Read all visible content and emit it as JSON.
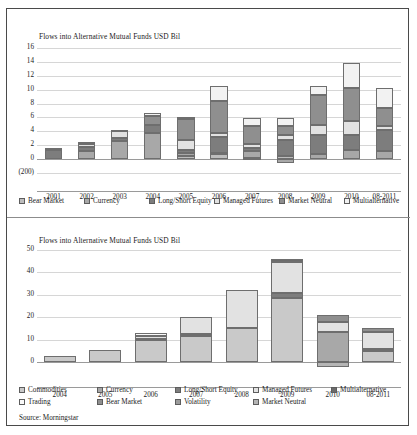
{
  "figure": {
    "source_note": "Source: Morningstar",
    "palette": {
      "bear_market": "#bdbdbd",
      "currency": "#a8a8a8",
      "long_short_equity": "#7d7d7d",
      "managed_futures": "#e2e2e2",
      "market_neutral": "#8f8f8f",
      "multialternative": "#f2f2f2",
      "commodities": "#c9c9c9",
      "trading": "#fafafa",
      "volatility": "#9b9b9b",
      "grid": "#d6d6d6",
      "axis": "#9a9a9a",
      "border": "#4a4a4a",
      "text": "#1c1c1c"
    }
  },
  "chart_data": [
    {
      "type": "bar",
      "id": "top-chart",
      "stacked": true,
      "title": "Flows into Alternative Mutual Funds USD Bil",
      "xlabel": "",
      "ylabel": "",
      "ylim": [
        -2,
        17
      ],
      "yticks": [
        "16",
        "14",
        "12",
        "10",
        "8",
        "6",
        "4",
        "2",
        "0",
        "(200)"
      ],
      "ytick_values": [
        16,
        14,
        12,
        10,
        8,
        6,
        4,
        2,
        0,
        -2
      ],
      "grid": true,
      "legend_position": "bottom",
      "categories": [
        "2001",
        "2002",
        "2003",
        "2004",
        "2005",
        "2006",
        "2007",
        "2008",
        "2009",
        "2010",
        "08-2011"
      ],
      "series": [
        {
          "name": "Bear Market",
          "color": "#bdbdbd",
          "values": [
            0.0,
            0.0,
            0.0,
            0.0,
            0.5,
            0.7,
            0.2,
            0.4,
            0.0,
            0.0,
            0.0
          ]
        },
        {
          "name": "Currency",
          "color": "#a8a8a8",
          "values": [
            0.0,
            1.1,
            2.6,
            3.8,
            0.4,
            0.2,
            0.9,
            -0.5,
            0.8,
            1.3,
            1.2
          ]
        },
        {
          "name": "Long/Short Equity",
          "color": "#7d7d7d",
          "values": [
            1.3,
            0.6,
            0.5,
            1.1,
            0.4,
            2.3,
            0.5,
            2.4,
            2.6,
            2.2,
            3.0
          ]
        },
        {
          "name": "Managed Futures",
          "color": "#e2e2e2",
          "values": [
            0.0,
            0.5,
            0.9,
            0.0,
            1.4,
            0.5,
            0.6,
            0.6,
            1.5,
            2.0,
            0.6
          ]
        },
        {
          "name": "Market Neutral",
          "color": "#8f8f8f",
          "values": [
            0.3,
            0.3,
            0.2,
            1.3,
            3.1,
            4.6,
            2.5,
            1.4,
            4.3,
            4.7,
            2.6
          ]
        },
        {
          "name": "Multialternative",
          "color": "#f2f2f2",
          "values": [
            0.0,
            0.0,
            0.0,
            0.5,
            0.3,
            2.2,
            1.2,
            1.1,
            1.3,
            3.6,
            2.8
          ]
        }
      ],
      "totals": [
        1.6,
        2.5,
        4.2,
        6.7,
        6.1,
        10.5,
        5.9,
        5.9,
        12.0,
        16.4,
        11.3
      ]
    },
    {
      "type": "bar",
      "id": "bottom-chart",
      "stacked": true,
      "title": "Flows into Alternative Mutual Funds USD Bil",
      "xlabel": "",
      "ylabel": "",
      "ylim": [
        -3,
        52
      ],
      "yticks": [
        "50",
        "40",
        "30",
        "20",
        "10",
        "0"
      ],
      "ytick_values": [
        50,
        40,
        30,
        20,
        10,
        0
      ],
      "grid": true,
      "legend_position": "bottom",
      "categories": [
        "2004",
        "2005",
        "2006",
        "2007",
        "2008",
        "2009",
        "2010",
        "08-2011"
      ],
      "series": [
        {
          "name": "Commodities",
          "color": "#c9c9c9",
          "values": [
            2.8,
            5.4,
            9.7,
            11.5,
            15.2,
            28.3,
            0.0,
            5.0
          ]
        },
        {
          "name": "Currency",
          "color": "#a8a8a8",
          "values": [
            0.0,
            0.0,
            0.0,
            0.0,
            0.0,
            0.0,
            13.5,
            0.0
          ]
        },
        {
          "name": "Long/Short Equity",
          "color": "#7d7d7d",
          "values": [
            0.0,
            0.0,
            0.8,
            1.0,
            0.0,
            2.2,
            0.0,
            1.0
          ]
        },
        {
          "name": "Managed Futures",
          "color": "#e2e2e2",
          "values": [
            0.0,
            0.0,
            1.0,
            7.5,
            16.8,
            13.8,
            4.5,
            7.6
          ]
        },
        {
          "name": "Multialternative",
          "color": "#6b6b6b",
          "values": [
            0.0,
            0.0,
            0.0,
            0.0,
            0.0,
            1.7,
            0.0,
            0.0
          ]
        },
        {
          "name": "Trading",
          "color": "#fafafa",
          "values": [
            0.0,
            0.0,
            1.5,
            0.0,
            0.0,
            0.0,
            0.0,
            0.0
          ]
        },
        {
          "name": "Bear Market",
          "color": "#8f8f8f",
          "values": [
            0.0,
            0.0,
            0.0,
            0.0,
            0.0,
            0.0,
            3.1,
            1.7
          ]
        },
        {
          "name": "Volatility",
          "color": "#9b9b9b",
          "values": [
            0.0,
            0.0,
            0.0,
            0.0,
            0.0,
            0.0,
            0.0,
            0.0
          ]
        },
        {
          "name": "Market Neutral",
          "color": "#b5b5b5",
          "values": [
            0.0,
            0.0,
            0.0,
            0.0,
            0.0,
            0.0,
            -2.0,
            0.0
          ]
        }
      ],
      "totals": [
        2.8,
        5.4,
        13.0,
        20.0,
        32.0,
        46.0,
        21.1,
        15.3
      ]
    }
  ]
}
